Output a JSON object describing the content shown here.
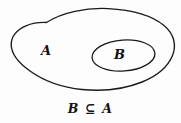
{
  "diagram": {
    "type": "euler-diagram",
    "title": "",
    "background_color": "#fdfdfd",
    "stroke_color": "#1a1a1a",
    "outer_set": {
      "label": "A",
      "shape": "blob",
      "name": "set-a"
    },
    "inner_set": {
      "label": "B",
      "shape": "ellipse",
      "name": "set-b"
    },
    "caption": "B ⊆ A",
    "relation_symbol": "⊆",
    "relation_meaning": "subset-or-equal"
  }
}
